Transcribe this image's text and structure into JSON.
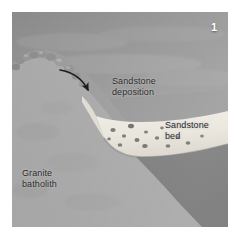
{
  "figure": {
    "panel_number": "1",
    "labels": {
      "deposition": "Sandstone\ndeposition",
      "bed": "Sandstone\nbed",
      "granite": "Granite\nbatholith"
    },
    "colors": {
      "plate_background": "#9a9a9a",
      "sky_upper": "#8f8f8f",
      "granite_mass": "#a3a3a3",
      "sandstone_bed": "#e8e5dd",
      "foreground_dark": "#6f6f6f",
      "arrow": "#1c1c1c",
      "label_text": "#2a2a2a",
      "panel_number_text": "#ffffff",
      "page_background": "#ffffff"
    }
  }
}
